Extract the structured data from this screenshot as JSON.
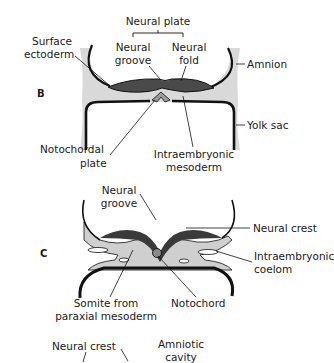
{
  "panels": {
    "b": {
      "letter": "B",
      "labels": {
        "neural_plate": "Neural plate",
        "surface_ectoderm_1": "Surface",
        "surface_ectoderm_2": "ectoderm",
        "neural_groove_1": "Neural",
        "neural_groove_2": "groove",
        "neural_fold_1": "Neural",
        "neural_fold_2": "fold",
        "amnion": "Amnion",
        "yolk_sac": "Yolk sac",
        "notochordal_plate_1": "Notochordal",
        "notochordal_plate_2": "plate",
        "intraembryonic_mesoderm_1": "Intraembryonic",
        "intraembryonic_mesoderm_2": "mesoderm"
      }
    },
    "c": {
      "letter": "C",
      "labels": {
        "neural_groove_1": "Neural",
        "neural_groove_2": "groove",
        "neural_crest": "Neural crest",
        "intraembryonic_coelom_1": "Intraembryonic",
        "intraembryonic_coelom_2": "coelom",
        "somite_1": "Somite from",
        "somite_2": "paraxial mesoderm",
        "notochord": "Notochord"
      }
    },
    "d": {
      "labels": {
        "neural_crest": "Neural crest",
        "amniotic_cavity_1": "Amniotic",
        "amniotic_cavity_2": "cavity"
      }
    }
  },
  "colors": {
    "outline": "#111111",
    "ectoderm_dark": "#4a4a4a",
    "mesoderm_light": "#cfcfcf",
    "background_gray": "#d9d9d9"
  }
}
